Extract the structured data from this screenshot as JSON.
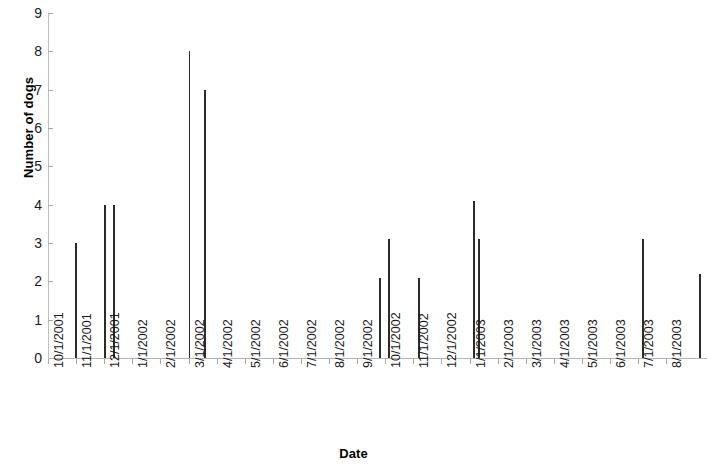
{
  "chart_data": {
    "type": "bar",
    "title": "",
    "xlabel": "Date",
    "ylabel": "Number of dogs",
    "ylim": [
      0,
      9
    ],
    "y_ticks": [
      0,
      1,
      2,
      3,
      4,
      5,
      6,
      7,
      8,
      9
    ],
    "grid": false,
    "legend": "none",
    "categories": [
      "10/1/2001",
      "11/1/2001",
      "12/1/2001",
      "1/1/2002",
      "2/1/2002",
      "3/1/2002",
      "4/1/2002",
      "5/1/2002",
      "6/1/2002",
      "7/1/2002",
      "8/1/2002",
      "9/1/2002",
      "10/1/2002",
      "11/1/2002",
      "12/1/2002",
      "1/1/2003",
      "2/1/2003",
      "3/1/2003",
      "4/1/2003",
      "5/1/2003",
      "6/1/2003",
      "7/1/2003",
      "8/1/2003"
    ],
    "points": [
      {
        "x_date": "10/21/2001",
        "x_frac": 0.96,
        "value": 3
      },
      {
        "x_date": "11/27/2001",
        "x_frac": 2.0,
        "value": 4
      },
      {
        "x_date": "12/9/2001",
        "x_frac": 2.32,
        "value": 4
      },
      {
        "x_date": "2/25/2002",
        "x_frac": 5.0,
        "value": 8
      },
      {
        "x_date": "3/14/2002",
        "x_frac": 5.55,
        "value": 7
      },
      {
        "x_date": "9/2/2002",
        "x_frac": 11.79,
        "value": 2.1
      },
      {
        "x_date": "9/12/2002",
        "x_frac": 12.1,
        "value": 3.1
      },
      {
        "x_date": "10/25/2002",
        "x_frac": 13.18,
        "value": 2.1
      },
      {
        "x_date": "12/12/2002",
        "x_frac": 15.14,
        "value": 4.1
      },
      {
        "x_date": "12/19/2002",
        "x_frac": 15.32,
        "value": 3.1
      },
      {
        "x_date": "5/28/2003",
        "x_frac": 21.14,
        "value": 3.1
      },
      {
        "x_date": "7/26/2003",
        "x_frac": 23.18,
        "value": 2.2
      },
      {
        "x_date": "8/5/2003",
        "x_frac": 23.46,
        "value": 3.1
      }
    ],
    "axis_color": "#a9a9a9",
    "series_color": "#2b2b2b"
  }
}
